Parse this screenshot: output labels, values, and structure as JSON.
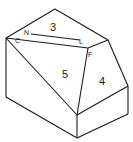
{
  "diagram": {
    "type": "isometric-solid",
    "face_labels": [
      "3",
      "5",
      "4"
    ],
    "vertex_labels": [
      "C",
      "N",
      "L",
      "F"
    ],
    "line_color": "#1a1a1a",
    "background": "#ffffff"
  }
}
